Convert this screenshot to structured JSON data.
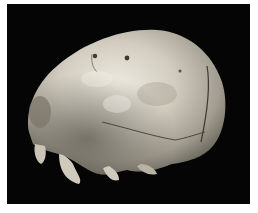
{
  "image": {
    "subject": "skull",
    "alt": "Photograph of a human skull cranium in side view against a black background",
    "colors": {
      "background": "#050505",
      "border": "#ffffff",
      "bone_light": "#e6e2d6",
      "bone_mid": "#b9b4a6",
      "bone_dark": "#6e6a60"
    }
  }
}
